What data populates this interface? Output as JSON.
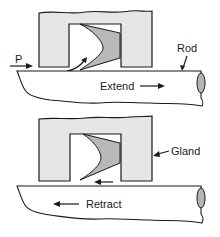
{
  "figure": {
    "colors": {
      "gland_fill": "#e6e6e6",
      "seal_fill": "#b8b8b8",
      "rod_end_fill": "#b5b5b5",
      "stroke": "#1a1a1a"
    },
    "panels": [
      {
        "name": "extend",
        "labels": {
          "pressure": "P",
          "rod": "Rod",
          "motion": "Extend"
        },
        "motion_direction": "right"
      },
      {
        "name": "retract",
        "labels": {
          "gland": "Gland",
          "motion": "Retract"
        },
        "motion_direction": "left"
      }
    ]
  }
}
